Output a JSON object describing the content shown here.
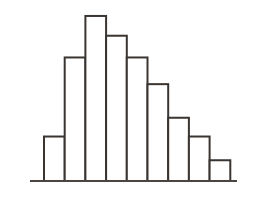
{
  "chart_data": {
    "type": "bar",
    "title": "",
    "subtitle": "",
    "xlabel": "",
    "ylabel": "",
    "categories": [
      "1",
      "2",
      "3",
      "4",
      "5",
      "6",
      "7",
      "8",
      "9"
    ],
    "values": [
      45,
      125,
      167,
      147,
      125,
      98,
      64,
      45,
      21
    ],
    "ylim": [
      0,
      170
    ],
    "xlim": [
      0,
      9
    ],
    "grid": false,
    "legend": null,
    "legend_position": "none",
    "annotations": [],
    "tick_labels_x": [],
    "tick_labels_y": [],
    "axis_visible": {
      "x": true,
      "y": false
    },
    "bar_style": {
      "fill": "#ffffff",
      "stroke": "#3a3531",
      "stroke_width": 2,
      "gap": 0
    },
    "baseline_color": "#4a4540",
    "background_color": "#ffffff"
  },
  "figure": {
    "width_px": 264,
    "height_px": 205,
    "plot_left_px": 30,
    "plot_right_px": 237,
    "baseline_y_px": 181,
    "bar_left_edge_px": 44,
    "bar_width_px": 20.7
  }
}
